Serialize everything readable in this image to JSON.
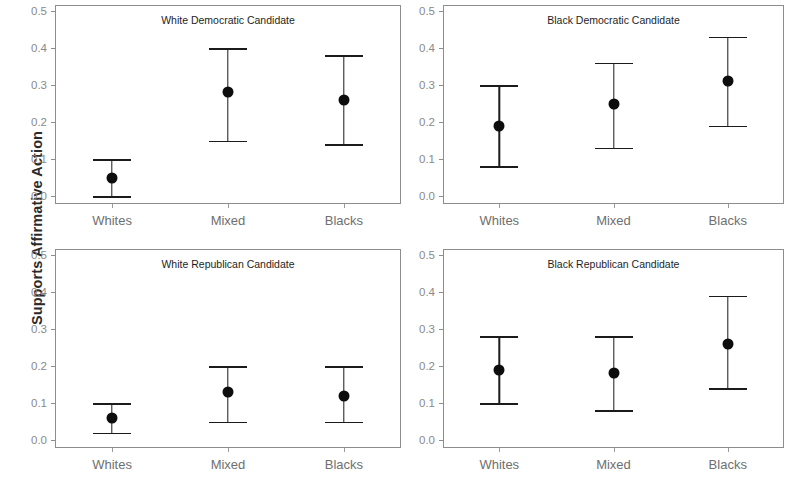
{
  "figure": {
    "ylabel": "Supports Affirmative Action",
    "xtick_labels": [
      "Whites",
      "Mixed",
      "Blacks"
    ],
    "ytick_labels": [
      "0.0",
      "0.1",
      "0.2",
      "0.3",
      "0.4",
      "0.5"
    ],
    "point_color": "#0d0d0d",
    "frame_color": "#8d8d8d",
    "tick_label_color": "#8a8a8a"
  },
  "chart_data": {
    "type": "scatter",
    "title": "",
    "xlabel": "",
    "ylabel": "Supports Affirmative Action",
    "ylim": [
      0.0,
      0.5
    ],
    "yticks": [
      0.0,
      0.1,
      0.2,
      0.3,
      0.4,
      0.5
    ],
    "categories": [
      "Whites",
      "Mixed",
      "Blacks"
    ],
    "grid": false,
    "legend": "none",
    "error_bar_style": "capped-vertical",
    "panels": [
      {
        "title": "White Democratic Candidate",
        "position": "top-left",
        "values": [
          0.05,
          0.28,
          0.26
        ],
        "ci_low": [
          0.0,
          0.15,
          0.14
        ],
        "ci_high": [
          0.1,
          0.4,
          0.38
        ]
      },
      {
        "title": "Black Democratic Candidate",
        "position": "top-right",
        "values": [
          0.19,
          0.25,
          0.31
        ],
        "ci_low": [
          0.08,
          0.13,
          0.19
        ],
        "ci_high": [
          0.3,
          0.36,
          0.43
        ]
      },
      {
        "title": "White Republican Candidate",
        "position": "bottom-left",
        "values": [
          0.06,
          0.13,
          0.12
        ],
        "ci_low": [
          0.02,
          0.05,
          0.05
        ],
        "ci_high": [
          0.1,
          0.2,
          0.2
        ]
      },
      {
        "title": "Black Republican Candidate",
        "position": "bottom-right",
        "values": [
          0.19,
          0.18,
          0.26
        ],
        "ci_low": [
          0.1,
          0.08,
          0.14
        ],
        "ci_high": [
          0.28,
          0.28,
          0.39
        ]
      }
    ]
  }
}
